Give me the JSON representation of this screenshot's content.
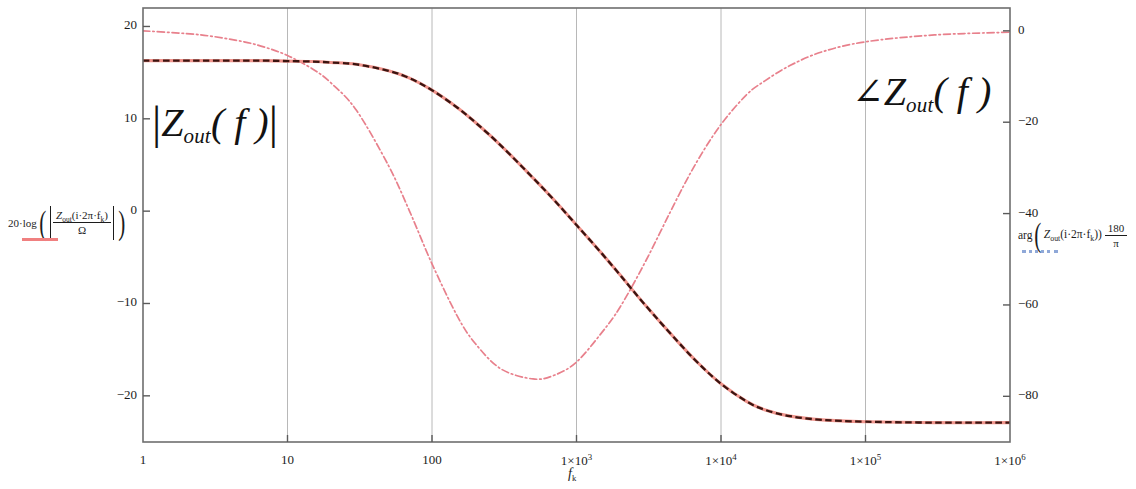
{
  "chart_data": {
    "type": "line",
    "title": "",
    "subtitle": "",
    "xlabel": "f_k",
    "xscale": "log",
    "xlim": [
      1,
      1000000
    ],
    "grid": true,
    "grid_x_at": [
      10,
      100,
      1000,
      10000,
      100000
    ],
    "legend_position": "outside-left-and-right",
    "x_ticks": [
      {
        "value": 1,
        "label_main": "1",
        "label_exp": ""
      },
      {
        "value": 10,
        "label_main": "10",
        "label_exp": ""
      },
      {
        "value": 100,
        "label_main": "100",
        "label_exp": ""
      },
      {
        "value": 1000,
        "label_main": "1×10",
        "label_exp": "3"
      },
      {
        "value": 10000,
        "label_main": "1×10",
        "label_exp": "4"
      },
      {
        "value": 100000,
        "label_main": "1×10",
        "label_exp": "5"
      },
      {
        "value": 1000000,
        "label_main": "1×10",
        "label_exp": "6"
      }
    ],
    "axes": [
      {
        "id": "left",
        "name": "magnitude",
        "ylabel": "20·log(|Z_out(i·2π·f_k)/Ω|)",
        "unit": "dB",
        "ylim": [
          -25,
          22
        ],
        "ticks": [
          20,
          10,
          0,
          -10,
          -20
        ],
        "tick_labels": [
          "20",
          "10",
          "0",
          "−10",
          "−20"
        ]
      },
      {
        "id": "right",
        "name": "phase",
        "ylabel": "arg(Z_out(i·2π·f_k))·180/π",
        "unit": "deg",
        "ylim": [
          -90,
          5
        ],
        "ticks": [
          0,
          -20,
          -40,
          -60,
          -80
        ],
        "tick_labels": [
          "0",
          "−20",
          "−40",
          "−60",
          "−80"
        ]
      }
    ],
    "series": [
      {
        "name": "magnitude",
        "label": "|Z_out(f)|",
        "axis": "left",
        "color": "#f0948c",
        "overlay_color": "#3a1410",
        "style": "dashed",
        "x": [
          1,
          2,
          3,
          5,
          7,
          10,
          15,
          20,
          30,
          50,
          70,
          100,
          150,
          200,
          300,
          500,
          700,
          1000,
          1500,
          2000,
          3000,
          5000,
          7000,
          10000,
          15000,
          20000,
          30000,
          50000,
          100000,
          300000,
          1000000
        ],
        "y": [
          16.3,
          16.3,
          16.3,
          16.3,
          16.3,
          16.25,
          16.2,
          16.1,
          15.9,
          15.2,
          14.4,
          13.1,
          11.2,
          9.6,
          7.1,
          3.6,
          1.2,
          -1.5,
          -4.6,
          -6.9,
          -10.2,
          -14.1,
          -16.5,
          -18.7,
          -20.6,
          -21.5,
          -22.2,
          -22.6,
          -22.8,
          -22.9,
          -22.9
        ]
      },
      {
        "name": "phase",
        "label": "∠Z_out(f)",
        "axis": "right",
        "color": "#e8808c",
        "overlay_color": "#e8808c",
        "style": "dashdot",
        "x": [
          1,
          2,
          3,
          5,
          7,
          10,
          15,
          20,
          30,
          50,
          70,
          100,
          150,
          200,
          300,
          500,
          700,
          1000,
          1500,
          2000,
          3000,
          5000,
          7000,
          10000,
          15000,
          20000,
          30000,
          50000,
          100000,
          300000,
          1000000
        ],
        "y": [
          0,
          -0.6,
          -1.2,
          -2.4,
          -3.6,
          -5.4,
          -8.4,
          -11.4,
          -17.4,
          -29.5,
          -39.5,
          -51.0,
          -62.5,
          -68.5,
          -74.0,
          -76.2,
          -75.4,
          -72.5,
          -66.0,
          -60.5,
          -50.5,
          -36.5,
          -28.0,
          -20.5,
          -14.0,
          -11.0,
          -7.6,
          -4.6,
          -2.4,
          -0.9,
          -0.3
        ]
      }
    ]
  },
  "annotations": {
    "magnitude": {
      "prefix": "|",
      "symbol": "Z",
      "sub": "out",
      "arg": "( f )",
      "suffix": "|"
    },
    "phase": {
      "angle_glyph": "∠",
      "symbol": "Z",
      "sub": "out",
      "arg": "( f )"
    }
  },
  "legend_left": {
    "lead": "20·log",
    "numerator_symbol": "Z",
    "numerator_sub": "out",
    "numerator_arg": "(i·2π·f",
    "numerator_arg_sub": "k",
    "numerator_arg_close": ")",
    "denominator": "Ω",
    "line_style": "solid",
    "color": "#f08080"
  },
  "legend_right": {
    "scale_tick": "−40",
    "func": "arg",
    "symbol": "Z",
    "sub": "out",
    "arg_open": "(i·2π·f",
    "arg_sub": "k",
    "arg_close": "))",
    "frac_num": "180",
    "frac_den": "π",
    "line_style": "dotted",
    "color": "#8fa8d8"
  },
  "xaxis_title": {
    "symbol": "f",
    "sub": "k"
  },
  "colors": {
    "frame": "#6e6e6e",
    "grid": "#b8b8b8",
    "magnitude_base": "#f0948c",
    "magnitude_dash": "#3a1410",
    "phase": "#e8808c",
    "background": "#ffffff"
  }
}
